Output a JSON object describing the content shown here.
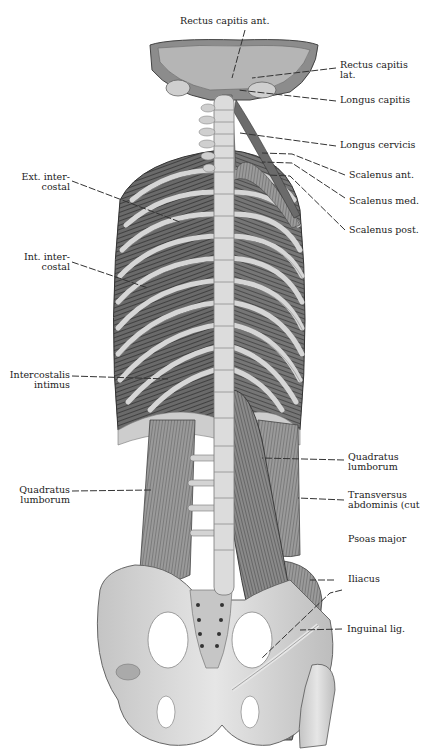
{
  "figure": {
    "colors": {
      "background": "#ffffff",
      "bone": "#d8d8d8",
      "bone_shade": "#a8a8a8",
      "muscle_dark": "#4a4a4a",
      "muscle_mid": "#7a7a7a",
      "muscle_light": "#b8b8b8",
      "leader_line": "#333333",
      "text": "#222222"
    }
  },
  "labels": {
    "rectus_capitis_ant": {
      "lines": [
        "Rectus capitis ant."
      ]
    },
    "rectus_capitis_lat": {
      "lines": [
        "Rectus capitis",
        "lat."
      ]
    },
    "longus_capitis": {
      "lines": [
        "Longus capitis"
      ]
    },
    "longus_cervicis": {
      "lines": [
        "Longus cervicis"
      ]
    },
    "scalenus_ant": {
      "lines": [
        "Scalenus ant."
      ]
    },
    "scalenus_med": {
      "lines": [
        "Scalenus med."
      ]
    },
    "scalenus_post": {
      "lines": [
        "Scalenus post."
      ]
    },
    "ext_intercostal": {
      "lines": [
        "Ext. inter-",
        "costal"
      ]
    },
    "int_intercostal": {
      "lines": [
        "Int. inter-",
        "costal"
      ]
    },
    "intercostalis_intimus": {
      "lines": [
        "Intercostalis",
        "intimus"
      ]
    },
    "quadratus_lumborum_left": {
      "lines": [
        "Quadratus",
        "lumborum"
      ]
    },
    "quadratus_lumborum_right": {
      "lines": [
        "Quadratus",
        "lumborum"
      ]
    },
    "transversus_abdominis": {
      "lines": [
        "Transversus",
        "abdominis (cut"
      ]
    },
    "psoas_major": {
      "lines": [
        "Psoas major"
      ]
    },
    "iliacus": {
      "lines": [
        "Iliacus"
      ]
    },
    "inguinal_lig": {
      "lines": [
        "Inguinal lig."
      ]
    }
  }
}
